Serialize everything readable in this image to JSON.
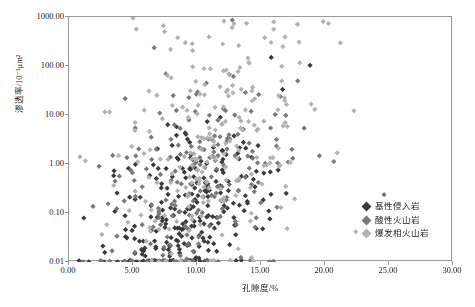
{
  "chart_data": {
    "type": "scatter",
    "title": "",
    "xlabel": "孔隙度/%",
    "ylabel": "渗透率/10⁻³μm²",
    "xlim": [
      0,
      30
    ],
    "ylim": [
      0.01,
      1000
    ],
    "yscale": "log",
    "xscale": "linear",
    "grid": false,
    "legend_position": "bottom-right",
    "xticks": [
      "0.00",
      "5.00",
      "10.00",
      "15.00",
      "20.00",
      "25.00",
      "30.00"
    ],
    "xtick_values": [
      0,
      5,
      10,
      15,
      20,
      25,
      30
    ],
    "yticks": [
      "0.01",
      "0.10",
      "1.00",
      "10.00",
      "100.00",
      "1000.00"
    ],
    "ytick_values": [
      0.01,
      0.1,
      1,
      10,
      100,
      1000
    ],
    "series": [
      {
        "name": "基性侵入岩",
        "color": "#3a3a3a",
        "marker": "diamond",
        "n_points": 268,
        "x_center": 9.2,
        "x_spread": 3.3,
        "y_log_center": -1.15,
        "y_log_spread": 0.95,
        "seed": 10771
      },
      {
        "name": "酸性火山岩",
        "color": "#787878",
        "marker": "diamond",
        "n_points": 206,
        "x_center": 9.6,
        "x_spread": 3.5,
        "y_log_center": -0.55,
        "y_log_spread": 1.15,
        "seed": 39023
      },
      {
        "name": "爆发相火山岩",
        "color": "#b2b2b2",
        "marker": "diamond",
        "n_points": 232,
        "x_center": 11.1,
        "x_spread": 4.0,
        "y_log_center": 0.25,
        "y_log_spread": 1.35,
        "seed": 61459
      }
    ]
  },
  "legend": {
    "items": [
      {
        "label": "基性侵入岩",
        "color": "#3a3a3a"
      },
      {
        "label": "酸性火山岩",
        "color": "#787878"
      },
      {
        "label": "爆发相火山岩",
        "color": "#b2b2b2"
      }
    ]
  },
  "frame": {
    "left": 68,
    "top": 16,
    "width": 384,
    "height": 245,
    "border_color": "#9a9a9a"
  }
}
